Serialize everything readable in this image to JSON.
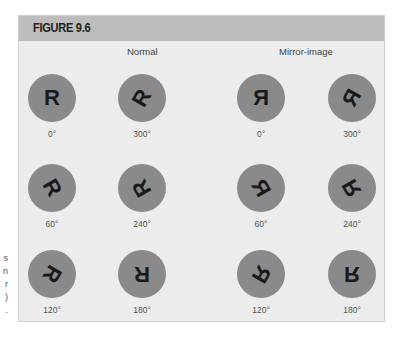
{
  "figure": {
    "title": "FIGURE 9.6",
    "side_caption_fragments": [
      "s",
      "n",
      "r",
      ")",
      "."
    ],
    "colors": {
      "panel_background": "#ececec",
      "header_background": "#bdbdbd",
      "circle": "#8a8a8a",
      "letter": "#1a1a1a"
    },
    "groups": [
      {
        "label": "Normal",
        "mirrored": false,
        "stimuli": [
          {
            "letter": "R",
            "angle_label": "0°",
            "rotation_deg": 0
          },
          {
            "letter": "R",
            "angle_label": "300°",
            "rotation_deg": 300
          },
          {
            "letter": "R",
            "angle_label": "60°",
            "rotation_deg": 60
          },
          {
            "letter": "R",
            "angle_label": "240°",
            "rotation_deg": 240
          },
          {
            "letter": "R",
            "angle_label": "120°",
            "rotation_deg": 120
          },
          {
            "letter": "R",
            "angle_label": "180°",
            "rotation_deg": 180
          }
        ]
      },
      {
        "label": "Mirror-image",
        "mirrored": true,
        "stimuli": [
          {
            "letter": "R",
            "angle_label": "0°",
            "rotation_deg": 0
          },
          {
            "letter": "R",
            "angle_label": "300°",
            "rotation_deg": 300
          },
          {
            "letter": "R",
            "angle_label": "60°",
            "rotation_deg": 60
          },
          {
            "letter": "R",
            "angle_label": "240°",
            "rotation_deg": 240
          },
          {
            "letter": "R",
            "angle_label": "120°",
            "rotation_deg": 120
          },
          {
            "letter": "R",
            "angle_label": "180°",
            "rotation_deg": 180
          }
        ]
      }
    ]
  }
}
